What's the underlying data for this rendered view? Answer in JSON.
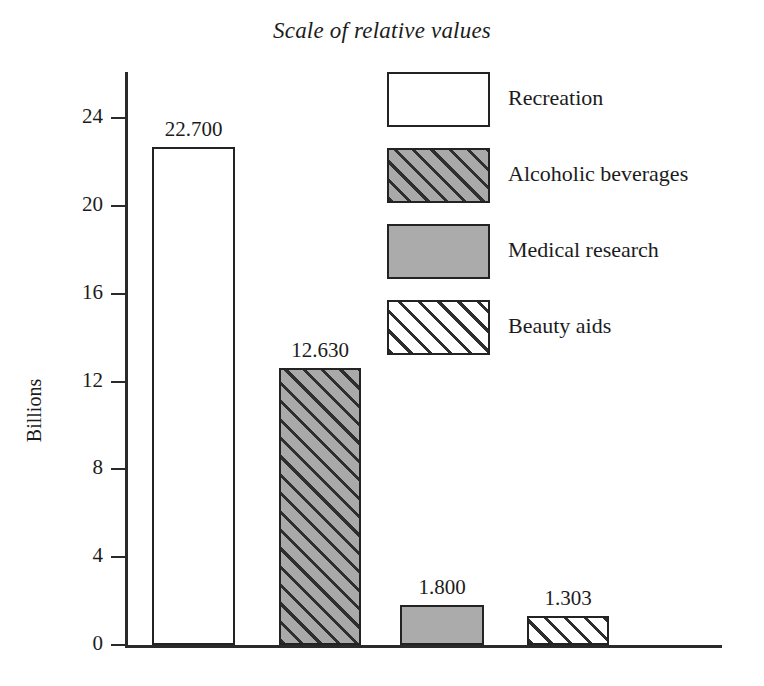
{
  "chart_data": {
    "type": "bar",
    "title": "Scale of relative values",
    "xlabel": "",
    "ylabel": "Billions",
    "ylim": [
      0,
      26
    ],
    "yticks": [
      0,
      4,
      8,
      12,
      16,
      20,
      24
    ],
    "ytick_labels": [
      "0",
      "4",
      "8",
      "12",
      "16",
      "20",
      "24"
    ],
    "grid": false,
    "legend_position": "upper-right-inside",
    "categories": [
      "Recreation",
      "Alcoholic beverages",
      "Medical research",
      "Beauty aids"
    ],
    "values": [
      22.7,
      12.63,
      1.8,
      1.303
    ],
    "value_labels": [
      "22.700",
      "12.630",
      "1.800",
      "1.303"
    ],
    "bars": [
      {
        "category": "Recreation",
        "value": 22.7,
        "label": "22.700",
        "fill": "white",
        "fill_color": "#ffffff",
        "edge_color": "#232323"
      },
      {
        "category": "Alcoholic beverages",
        "value": 12.63,
        "label": "12.630",
        "fill": "hatch-dark",
        "fill_color": "#a9a9a9",
        "edge_color": "#232323"
      },
      {
        "category": "Medical research",
        "value": 1.8,
        "label": "1.800",
        "fill": "gray",
        "fill_color": "#ababab",
        "edge_color": "#232323"
      },
      {
        "category": "Beauty aids",
        "value": 1.303,
        "label": "1.303",
        "fill": "hatch-light",
        "fill_color": "#ffffff",
        "edge_color": "#232323"
      }
    ],
    "legend": [
      {
        "label": "Recreation",
        "fill": "white"
      },
      {
        "label": "Alcoholic beverages",
        "fill": "hatch-dark"
      },
      {
        "label": "Medical research",
        "fill": "gray"
      },
      {
        "label": "Beauty aids",
        "fill": "hatch-light"
      }
    ],
    "colors": {
      "background": "#ffffff",
      "axis": "#2a2a2a",
      "text": "#1c1c1c",
      "bar_edge": "#232323",
      "gray_fill": "#ababab",
      "hatch_line": "#2e2e2e"
    }
  }
}
